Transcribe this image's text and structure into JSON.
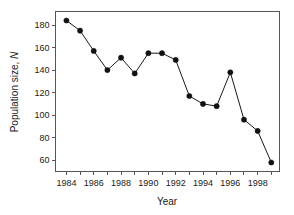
{
  "chart_data": {
    "type": "line",
    "title": "",
    "subtitle": "",
    "xlabel": "Year",
    "ylabel": "Population size, N",
    "ylabel_plain": "Population size,",
    "ylabel_symbol": "N",
    "x": [
      1984,
      1985,
      1986,
      1987,
      1988,
      1989,
      1990,
      1991,
      1992,
      1993,
      1994,
      1995,
      1996,
      1997,
      1998,
      1999
    ],
    "values": [
      184,
      175,
      157,
      140,
      151,
      137,
      155,
      155,
      149,
      117,
      110,
      108,
      138,
      96,
      86,
      58
    ],
    "series": [
      {
        "name": "Population size",
        "values": [
          184,
          175,
          157,
          140,
          151,
          137,
          155,
          155,
          149,
          117,
          110,
          108,
          138,
          96,
          86,
          58
        ]
      }
    ],
    "xlim": [
      1983.2,
      1999.6
    ],
    "ylim": [
      50,
      192
    ],
    "xticks": [
      1984,
      1985,
      1986,
      1987,
      1988,
      1989,
      1990,
      1991,
      1992,
      1993,
      1994,
      1995,
      1996,
      1997,
      1998,
      1999
    ],
    "xtick_labels": [
      "1984",
      "",
      "1986",
      "",
      "1988",
      "",
      "1990",
      "",
      "1992",
      "",
      "1994",
      "",
      "1996",
      "",
      "1998",
      ""
    ],
    "xtick_labels_shown": [
      "1984",
      "1986",
      "1988",
      "1990",
      "1992",
      "1994",
      "1996",
      "1998"
    ],
    "yticks": [
      60,
      80,
      100,
      120,
      140,
      160,
      180
    ],
    "ytick_labels": [
      "60",
      "80",
      "100",
      "120",
      "140",
      "160",
      "180"
    ],
    "grid": false,
    "legend": false,
    "legend_position": "none",
    "marker": "filled-circle",
    "line_color": "#111111",
    "marker_color": "#111111",
    "frame_color": "#555555",
    "background_color": "#ffffff"
  }
}
